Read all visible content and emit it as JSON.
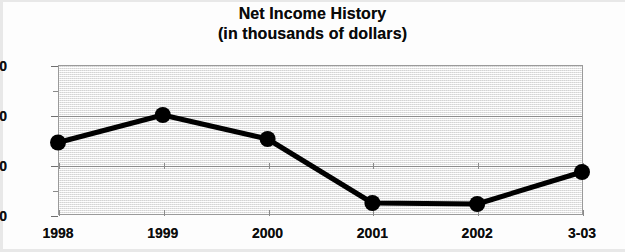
{
  "chart_data": {
    "type": "line",
    "title": "Net Income History",
    "subtitle": "(in thousands of dollars)",
    "xlabel": "",
    "ylabel": "",
    "categories": [
      "1998",
      "1999",
      "2000",
      "2001",
      "2002",
      "3-03"
    ],
    "values": [
      450,
      1000,
      520,
      -760,
      -780,
      -140
    ],
    "series": [
      {
        "name": "Net Income",
        "values": [
          450,
          1000,
          520,
          -760,
          -780,
          -140
        ]
      }
    ],
    "ylim": [
      -1000,
      2000
    ],
    "ytick_labels": [
      "2000",
      "1000",
      "0",
      "-1000"
    ],
    "ytick_values": [
      2000,
      1000,
      0,
      -1000
    ],
    "yminor_tick_values": [
      1500,
      500,
      -500
    ],
    "gridline_values": [
      1000,
      0
    ],
    "grid": true,
    "legend": "none",
    "marker": "filled-circle",
    "line_color": "#000000",
    "marker_color": "#000000",
    "plot_background": "#f2f2f2",
    "axis_color": "#8d8d8d"
  },
  "figure": {
    "title_line_1": "Net Income History",
    "title_line_2": "(in thousands of dollars)"
  }
}
